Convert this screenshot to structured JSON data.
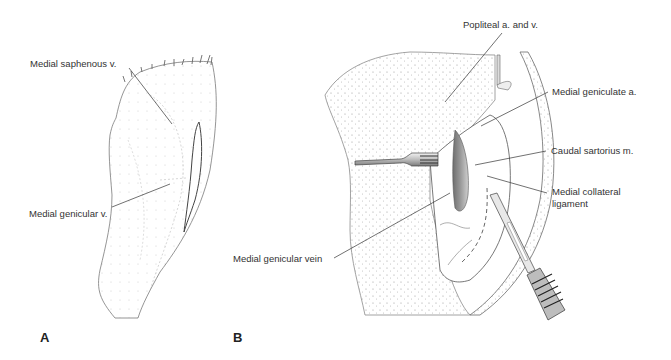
{
  "figure": {
    "panels": [
      {
        "id": "A",
        "letter": "A",
        "labels": [
          {
            "text": "Medial saphenous v."
          },
          {
            "text": "Medial genicular v."
          }
        ]
      },
      {
        "id": "B",
        "letter": "B",
        "labels": [
          {
            "text": "Popliteal a. and v."
          },
          {
            "text": "Medial geniculate a."
          },
          {
            "text": "Caudal sartorius m."
          },
          {
            "text": "Medial collateral"
          },
          {
            "text": "ligament"
          },
          {
            "text": "Medial genicular vein"
          }
        ]
      }
    ]
  }
}
